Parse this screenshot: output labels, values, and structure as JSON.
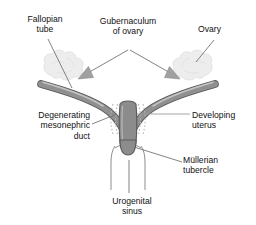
{
  "figure": {
    "background_color": "#ffffff",
    "width": 256,
    "height": 225
  },
  "labels": {
    "fallopian_tube": "Fallopian\ntube",
    "gubernaculum_of_ovary": "Gubernaculum\nof ovary",
    "ovary": "Ovary",
    "degenerating_mesonephric_duct": "Degenerating\nmesonephric\nduct",
    "developing_uterus": "Developing\nuterus",
    "mullerian_tubercle": "Müllerian\ntubercle",
    "urogenital_sinus": "Urogenital\nsinus"
  },
  "anatomy": {
    "duct_fill": "#8c8c8c",
    "duct_outline": "#555555",
    "duct_highlight": "#c9c9c9",
    "ovary_fill": "#ededed",
    "ovary_outline": "#d2d2d2",
    "sinus_outline": "#8f8f8f",
    "mesonephric_dash": "#bdbdbd",
    "leader_line_color": "#5a5a5a",
    "arrow_fill": "#9a9a9a",
    "parts": [
      "fallopian-tube-left",
      "fallopian-tube-right",
      "ovary-left",
      "ovary-right",
      "gubernaculum-arrow-left",
      "gubernaculum-arrow-right",
      "developing-uterus",
      "degenerating-mesonephric-duct-left",
      "degenerating-mesonephric-duct-right",
      "mullerian-tubercle",
      "urogenital-sinus"
    ]
  }
}
